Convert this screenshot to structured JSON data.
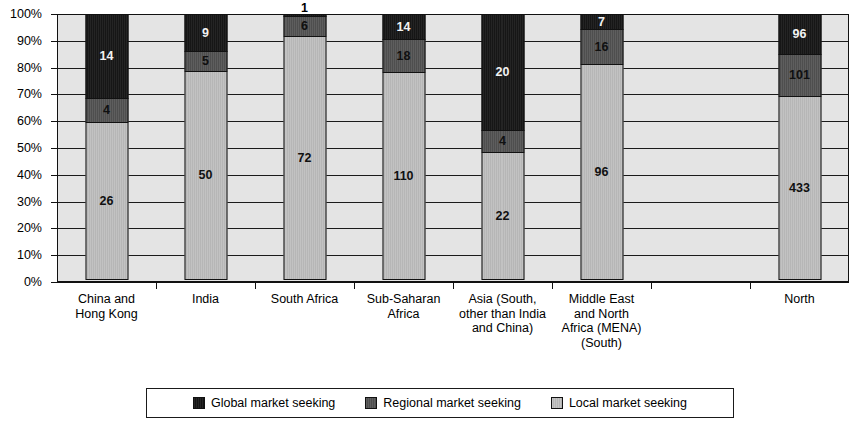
{
  "chart_data": {
    "type": "bar",
    "subtype": "100% stacked column",
    "title": "",
    "xlabel": "",
    "ylabel": "",
    "ylim": [
      0,
      100
    ],
    "ytick_labels": [
      "0%",
      "10%",
      "20%",
      "30%",
      "40%",
      "50%",
      "60%",
      "70%",
      "80%",
      "90%",
      "100%"
    ],
    "ytick_values": [
      0,
      10,
      20,
      30,
      40,
      50,
      60,
      70,
      80,
      90,
      100
    ],
    "grid": true,
    "legend_position": "bottom",
    "categories": [
      "China and Hong Kong",
      "India",
      "South Africa",
      "Sub-Saharan Africa",
      "Asia (South, other than India and China)",
      "Middle East and North Africa (MENA) (South)",
      "",
      "North"
    ],
    "category_label_lines": [
      [
        "China and",
        "Hong Kong"
      ],
      [
        "India"
      ],
      [
        "South Africa"
      ],
      [
        "Sub-Saharan",
        "Africa"
      ],
      [
        "Asia (South,",
        "other than India",
        "and China)"
      ],
      [
        "Middle East",
        "and North",
        "Africa (MENA)",
        "(South)"
      ],
      [
        ""
      ],
      [
        "North"
      ]
    ],
    "series": [
      {
        "name": "Global market seeking",
        "color": "#1d1d1d",
        "values": [
          14,
          9,
          1,
          14,
          20,
          7,
          null,
          96
        ],
        "percentages": [
          31.8,
          14.1,
          1.3,
          9.9,
          43.5,
          5.9,
          null,
          15.2
        ]
      },
      {
        "name": "Regional market seeking",
        "color": "#575757",
        "values": [
          4,
          5,
          6,
          18,
          4,
          16,
          null,
          101
        ],
        "percentages": [
          9.1,
          7.8,
          7.6,
          12.7,
          8.7,
          13.4,
          null,
          16.0
        ]
      },
      {
        "name": "Local market seeking",
        "color": "#bcbcbc",
        "values": [
          26,
          50,
          72,
          110,
          22,
          96,
          null,
          433
        ],
        "percentages": [
          59.1,
          78.1,
          91.1,
          77.5,
          47.8,
          80.7,
          null,
          68.8
        ]
      }
    ],
    "totals": [
      44,
      64,
      79,
      142,
      46,
      119,
      null,
      630
    ]
  },
  "legend": {
    "items": [
      {
        "label": "Global market seeking",
        "swatch": "global-swatch"
      },
      {
        "label": "Regional market seeking",
        "swatch": "regional-swatch"
      },
      {
        "label": "Local market seeking",
        "swatch": "local-swatch"
      }
    ]
  }
}
